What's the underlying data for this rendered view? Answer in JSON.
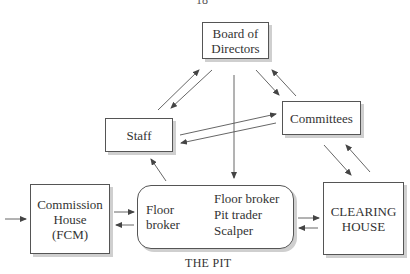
{
  "page_number": "18",
  "nodes": {
    "board": {
      "lines": [
        "Board of",
        "Directors"
      ]
    },
    "committees": {
      "lines": [
        "Committees"
      ]
    },
    "staff": {
      "lines": [
        "Staff"
      ]
    },
    "commission_house": {
      "lines": [
        "Commission",
        "House",
        "(FCM)"
      ]
    },
    "clearing_house": {
      "lines": [
        "CLEARING",
        "HOUSE"
      ]
    },
    "pit": {
      "label": "THE PIT",
      "source_lines": [
        "Floor",
        "broker"
      ],
      "targets": [
        "Floor broker",
        "Pit trader",
        "Scalper"
      ]
    }
  },
  "edges": [
    {
      "from": "staff",
      "to": "board"
    },
    {
      "from": "board",
      "to": "staff"
    },
    {
      "from": "board",
      "to": "committees"
    },
    {
      "from": "committees",
      "to": "board"
    },
    {
      "from": "board",
      "to": "pit"
    },
    {
      "from": "staff",
      "to": "committees"
    },
    {
      "from": "committees",
      "to": "staff"
    },
    {
      "from": "committees",
      "to": "clearing_house"
    },
    {
      "from": "clearing_house",
      "to": "committees"
    },
    {
      "from": "pit",
      "to": "staff"
    },
    {
      "from": "external",
      "to": "commission_house"
    },
    {
      "from": "commission_house",
      "to": "pit"
    },
    {
      "from": "pit",
      "to": "commission_house"
    },
    {
      "from": "pit",
      "to": "clearing_house"
    },
    {
      "from": "clearing_house",
      "to": "pit"
    },
    {
      "from": "floor_broker",
      "to": "floor_broker_target",
      "bidirectional": true
    },
    {
      "from": "floor_broker",
      "to": "pit_trader",
      "bidirectional": true
    },
    {
      "from": "floor_broker",
      "to": "scalper",
      "bidirectional": true
    }
  ],
  "colors": {
    "line": "#555555",
    "shadow": "#cfcfcf",
    "text": "#333333"
  }
}
